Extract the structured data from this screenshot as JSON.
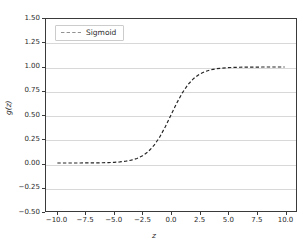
{
  "chart_data": {
    "type": "line",
    "title": "",
    "xlabel": "z",
    "ylabel": "g(z)",
    "xlim": [
      -11.0,
      11.0
    ],
    "ylim": [
      -0.5,
      1.5
    ],
    "grid": true,
    "grid_axis": "y",
    "legend_position": "upper left",
    "xticks": [
      -10.0,
      -7.5,
      -5.0,
      -2.5,
      0.0,
      2.5,
      5.0,
      7.5,
      10.0
    ],
    "xtick_labels": [
      "−10.0",
      "−7.5",
      "−5.0",
      "−2.5",
      "0.0",
      "2.5",
      "5.0",
      "7.5",
      "10.0"
    ],
    "yticks": [
      1.5,
      1.25,
      1.0,
      0.75,
      0.5,
      0.25,
      0.0,
      -0.25,
      -0.5
    ],
    "ytick_labels": [
      "1.50",
      "1.25",
      "1.00",
      "0.75",
      "0.50",
      "0.25",
      "0.00",
      "−0.25",
      "−0.50"
    ],
    "series": [
      {
        "name": "Sigmoid",
        "color": "#262626",
        "linestyle": "dashed",
        "linewidth": 1.2,
        "x": [
          -10.0,
          -9.5,
          -9.0,
          -8.5,
          -8.0,
          -7.5,
          -7.0,
          -6.5,
          -6.0,
          -5.5,
          -5.0,
          -4.5,
          -4.0,
          -3.5,
          -3.0,
          -2.5,
          -2.0,
          -1.5,
          -1.0,
          -0.5,
          0.0,
          0.5,
          1.0,
          1.5,
          2.0,
          2.5,
          3.0,
          3.5,
          4.0,
          4.5,
          5.0,
          5.5,
          6.0,
          6.5,
          7.0,
          7.5,
          8.0,
          8.5,
          9.0,
          9.5,
          10.0
        ],
        "y": [
          4.54e-05,
          7.49e-05,
          0.0001234,
          0.0002035,
          0.0003354,
          0.0005527,
          0.0009111,
          0.0015011,
          0.0024726,
          0.0040701,
          0.0066929,
          0.0109869,
          0.0179862,
          0.0293122,
          0.0474259,
          0.0758582,
          0.1192029,
          0.1824255,
          0.2689414,
          0.3775407,
          0.5,
          0.6224593,
          0.7310586,
          0.8175745,
          0.8807971,
          0.9241418,
          0.9525741,
          0.9706877,
          0.9820138,
          0.9890131,
          0.9933071,
          0.9959299,
          0.9975274,
          0.9984989,
          0.9990889,
          0.9994473,
          0.9996646,
          0.9997965,
          0.9998766,
          0.9999251,
          0.9999546
        ]
      }
    ]
  },
  "legend": {
    "entries": [
      {
        "label": "Sigmoid"
      }
    ]
  }
}
